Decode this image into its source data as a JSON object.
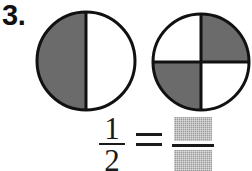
{
  "worksheet": {
    "problem_number": "3.",
    "background_color": "#ffffff",
    "shade_color": "#6b6b6b",
    "outline_color": "#111111",
    "blank_fill_color": "#9c9c9c"
  },
  "figures": [
    {
      "name": "circle-half",
      "description": "circle divided into 2 equal parts, left half shaded",
      "total_parts": 2,
      "shaded_parts": 1,
      "division": "vertical",
      "shaded_positions": [
        "left"
      ],
      "fraction_shown": "1/2"
    },
    {
      "name": "circle-quarters",
      "description": "circle divided into 4 equal parts, top-right and bottom-left shaded",
      "total_parts": 4,
      "shaded_parts": 2,
      "division": "quadrants",
      "shaded_positions": [
        "top-right",
        "bottom-left"
      ],
      "fraction_shown": "2/4"
    }
  ],
  "equation": {
    "left_fraction": {
      "numerator": "1",
      "denominator": "2"
    },
    "operator": "=",
    "right_fraction": {
      "numerator": "",
      "denominator": "",
      "numerator_placeholder": "",
      "denominator_placeholder": "",
      "is_blank": true
    }
  }
}
